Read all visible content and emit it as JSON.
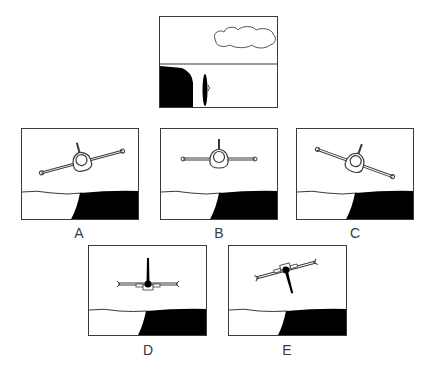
{
  "figure": {
    "colors": {
      "ink": "#3a3a3a",
      "ground": "#000000",
      "sky": "#ffffff"
    }
  },
  "reference_panel": {
    "name": "cockpit-view",
    "elements": [
      "cloud",
      "horizon-line",
      "cliff",
      "aircraft-edge-on"
    ]
  },
  "options": [
    {
      "label": "A",
      "attitude": "banked right, nose level",
      "bank_deg": -15
    },
    {
      "label": "B",
      "attitude": "wings level",
      "bank_deg": 0
    },
    {
      "label": "C",
      "attitude": "banked left",
      "bank_deg": 20
    },
    {
      "label": "D",
      "attitude": "wings level, viewed from rear",
      "bank_deg": 0
    },
    {
      "label": "E",
      "attitude": "inverted, banked",
      "bank_deg": -15
    }
  ]
}
